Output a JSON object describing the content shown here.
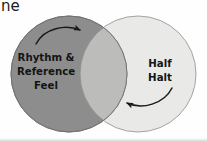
{
  "figure": {
    "type": "venn-diagram",
    "title_fragment": "ne",
    "background_color": "#fefefe",
    "width": 207,
    "height": 142
  },
  "venn": {
    "left_circle": {
      "label_lines": [
        "Rhythm &",
        "Reference",
        "Feel"
      ],
      "fill_color": "#8d8d8d",
      "stroke_color": "#767676",
      "cx": 69,
      "cy": 74,
      "r": 58
    },
    "right_circle": {
      "label_lines": [
        "Half",
        "Halt"
      ],
      "fill_color": "#e9e9e7",
      "stroke_color": "#9a9a98",
      "cx": 138,
      "cy": 74,
      "r": 58
    },
    "overlap": {
      "fill_color": "#bcbcba",
      "label": ""
    }
  },
  "arrows": [
    {
      "name": "arrow-left-to-right",
      "direction": "right",
      "color": "#1a1a1a",
      "description": "curved arrow from left circle toward overlap and right circle"
    },
    {
      "name": "arrow-right-to-left",
      "direction": "left",
      "color": "#1a1a1a",
      "description": "curved arrow from right circle back toward overlap and left circle"
    }
  ]
}
